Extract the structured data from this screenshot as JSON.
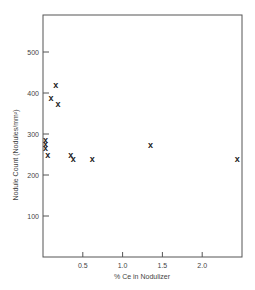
{
  "chart_data": {
    "type": "scatter",
    "title": "",
    "xlabel": "% Ce in Nodulizer",
    "ylabel": "Nodule Count (Nodules/mm²)",
    "xlim": [
      0,
      2.5
    ],
    "ylim": [
      0,
      580
    ],
    "xticks": [
      0.5,
      1.0,
      1.5,
      2.0
    ],
    "xtick_labels": [
      "0.5",
      "1.0",
      "1.5",
      "2.0"
    ],
    "yticks": [
      100,
      200,
      300,
      400,
      500
    ],
    "ytick_labels": [
      "100",
      "200",
      "300",
      "400",
      "500"
    ],
    "grid": false,
    "legend": null,
    "marker": "x",
    "series": [
      {
        "name": "Nodule Count",
        "points": [
          {
            "x": 0.16,
            "y": 420
          },
          {
            "x": 0.1,
            "y": 388
          },
          {
            "x": 0.19,
            "y": 372
          },
          {
            "x": 0.03,
            "y": 285
          },
          {
            "x": 0.03,
            "y": 275
          },
          {
            "x": 0.03,
            "y": 265
          },
          {
            "x": 0.06,
            "y": 250
          },
          {
            "x": 0.35,
            "y": 248
          },
          {
            "x": 0.38,
            "y": 240
          },
          {
            "x": 0.62,
            "y": 240
          },
          {
            "x": 1.35,
            "y": 272
          },
          {
            "x": 2.44,
            "y": 240
          }
        ]
      }
    ]
  }
}
